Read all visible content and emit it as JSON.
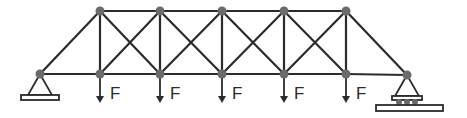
{
  "diagram": {
    "type": "truss",
    "colors": {
      "member": "#2b2b2b",
      "node": "#6b6b6b",
      "background": "#ffffff"
    },
    "nodes": {
      "bottom": [
        {
          "id": "B0",
          "x": 40,
          "y": 74,
          "support": "pin"
        },
        {
          "id": "B1",
          "x": 100,
          "y": 74
        },
        {
          "id": "B2",
          "x": 160,
          "y": 74
        },
        {
          "id": "B3",
          "x": 222,
          "y": 74
        },
        {
          "id": "B4",
          "x": 284,
          "y": 74
        },
        {
          "id": "B5",
          "x": 346,
          "y": 74
        },
        {
          "id": "B6",
          "x": 407,
          "y": 75,
          "support": "roller"
        }
      ],
      "top": [
        {
          "id": "T1",
          "x": 100,
          "y": 11
        },
        {
          "id": "T2",
          "x": 160,
          "y": 11
        },
        {
          "id": "T3",
          "x": 222,
          "y": 11
        },
        {
          "id": "T4",
          "x": 284,
          "y": 11
        },
        {
          "id": "T5",
          "x": 346,
          "y": 11
        }
      ]
    },
    "loads": [
      {
        "node": "B1",
        "label": "F"
      },
      {
        "node": "B2",
        "label": "F"
      },
      {
        "node": "B3",
        "label": "F"
      },
      {
        "node": "B4",
        "label": "F"
      },
      {
        "node": "B5",
        "label": "F"
      }
    ],
    "supports": {
      "left": "pin",
      "right": "roller"
    }
  }
}
